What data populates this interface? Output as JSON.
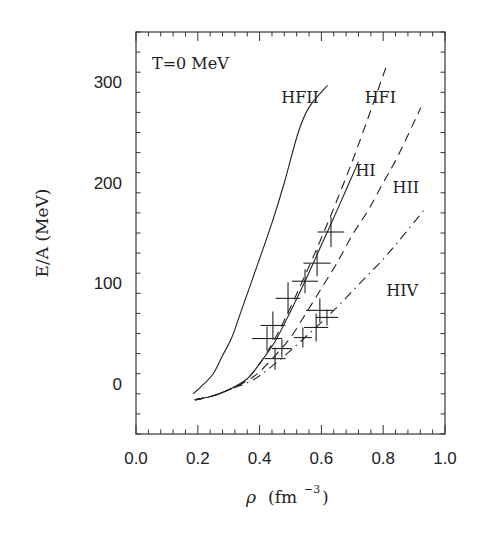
{
  "chart_data": {
    "type": "line",
    "title": "T=0 MeV",
    "xlabel": "ρ (fm⁻³)",
    "xlabel_parts": {
      "symbol": "ρ",
      "unit": "(fm",
      "exp": "−3",
      "close": ")"
    },
    "ylabel": "E/A (MeV)",
    "xlim": [
      0.0,
      1.0
    ],
    "ylim": [
      -50,
      350
    ],
    "xticks": [
      "0.0",
      "0.2",
      "0.4",
      "0.6",
      "0.8",
      "1.0"
    ],
    "yticks": [
      "0",
      "100",
      "200",
      "300"
    ],
    "grid": false,
    "legend": "inline curve labels",
    "series": [
      {
        "name": "HFII",
        "style": "solid",
        "label_pos": [
          0.47,
          285
        ],
        "x": [
          0.185,
          0.21,
          0.25,
          0.28,
          0.31,
          0.34,
          0.395,
          0.44,
          0.48,
          0.525,
          0.56,
          0.62
        ],
        "y": [
          -10,
          -3,
          10,
          28,
          46,
          72,
          120,
          160,
          200,
          250,
          275,
          297
        ]
      },
      {
        "name": "HFI",
        "style": "dashed",
        "label_pos": [
          0.74,
          285
        ],
        "x": [
          0.19,
          0.25,
          0.3,
          0.35,
          0.4,
          0.45,
          0.5,
          0.55,
          0.6,
          0.66,
          0.72,
          0.815
        ],
        "y": [
          -16,
          -12,
          -6,
          2,
          20,
          45,
          76,
          110,
          145,
          190,
          238,
          320
        ]
      },
      {
        "name": "HI",
        "style": "solid",
        "label_pos": [
          0.71,
          213
        ],
        "x": [
          0.19,
          0.25,
          0.3,
          0.36,
          0.4,
          0.45,
          0.5,
          0.55,
          0.6,
          0.65,
          0.72
        ],
        "y": [
          -16,
          -12,
          -6,
          5,
          20,
          42,
          72,
          104,
          138,
          172,
          221
        ]
      },
      {
        "name": "HII",
        "style": "dashed",
        "label_pos": [
          0.83,
          196
        ],
        "x": [
          0.19,
          0.25,
          0.3,
          0.36,
          0.4,
          0.45,
          0.5,
          0.55,
          0.6,
          0.65,
          0.7,
          0.75,
          0.8,
          0.85,
          0.922
        ],
        "y": [
          -16,
          -12,
          -6,
          3,
          12,
          28,
          46,
          70,
          95,
          120,
          148,
          172,
          200,
          228,
          275
        ]
      },
      {
        "name": "HIV",
        "style": "dashdot",
        "label_pos": [
          0.81,
          93
        ],
        "x": [
          0.19,
          0.25,
          0.3,
          0.36,
          0.4,
          0.45,
          0.5,
          0.55,
          0.6,
          0.65,
          0.7,
          0.75,
          0.8,
          0.85,
          0.93
        ],
        "y": [
          -16,
          -12,
          -6,
          1,
          8,
          20,
          33,
          47,
          61,
          76,
          92,
          108,
          124,
          142,
          172
        ]
      }
    ],
    "data_points": {
      "name": "experimental points",
      "x": [
        0.631,
        0.586,
        0.547,
        0.492,
        0.443,
        0.424,
        0.472,
        0.45,
        0.54,
        0.583,
        0.595,
        0.618
      ],
      "y": [
        151,
        120,
        102,
        85,
        58,
        45,
        35,
        25,
        46,
        56,
        73,
        66
      ],
      "dx": [
        0.043,
        0.044,
        0.042,
        0.04,
        0.04,
        0.049,
        0.032,
        0.034,
        0.029,
        0.039,
        0.045,
        0.036
      ],
      "dy": [
        15,
        13,
        12,
        16,
        14,
        12,
        9,
        11,
        10,
        14,
        12,
        8
      ]
    }
  },
  "layout": {
    "plot_box": {
      "left": 136,
      "right": 445,
      "top": 32,
      "bottom": 434
    },
    "x_minor_step": 0.04,
    "y_minor_step": 20,
    "ink_color": "#222222"
  }
}
